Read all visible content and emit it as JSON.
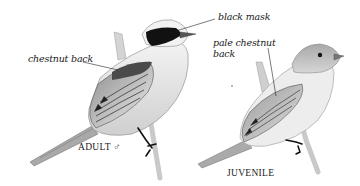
{
  "illustration": {
    "subject": "bird field guide plate",
    "adult": {
      "caption": "ADULT ♂",
      "annotations": {
        "mask": "black mask",
        "back": "chestnut back"
      }
    },
    "juvenile": {
      "caption": "JUVENILE",
      "annotations": {
        "back_line1": "pale chestnut",
        "back_line2": "back"
      }
    }
  },
  "colors": {
    "background": "#ffffff",
    "ink": "#1a1a1a",
    "mask": "#111111",
    "feather_dark": "#555555",
    "feather_mid": "#9a9a9a",
    "feather_light": "#d8d8d8"
  }
}
